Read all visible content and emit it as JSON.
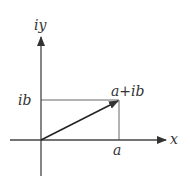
{
  "diagram": {
    "type": "complex-plane",
    "labels": {
      "y_axis": "iy",
      "x_axis": "x",
      "imag_tick": "ib",
      "real_tick": "a",
      "point": "a+ib"
    },
    "colors": {
      "axis": "#333333",
      "guide": "#555555",
      "vector": "#222222"
    }
  }
}
